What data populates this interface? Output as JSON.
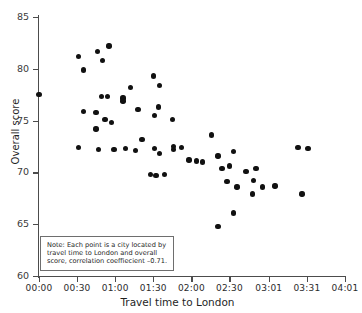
{
  "chart_data": {
    "type": "scatter",
    "title": "",
    "xlabel": "Travel time to London",
    "ylabel": "Overall score",
    "xlim": [
      0,
      241
    ],
    "ylim": [
      60,
      85
    ],
    "grid": false,
    "legend": null,
    "x_tick_labels": [
      "00:00",
      "00:30",
      "01:00",
      "01:30",
      "02:00",
      "02:30",
      "03:01",
      "03:31",
      "04:01"
    ],
    "x_tick_values": [
      0,
      30,
      60,
      90,
      120,
      150,
      181,
      211,
      241
    ],
    "y_tick_labels": [
      "60",
      "65",
      "70",
      "75",
      "80",
      "85"
    ],
    "y_tick_values": [
      60,
      65,
      70,
      75,
      80,
      85
    ],
    "annotation": "Note: Each point is a city located by travel time  to London and overall score, correlation coeffiecient –0.71.",
    "correlation_coefficient": -0.71,
    "point_color": "#111111",
    "axis_color": "#4c4c4c",
    "points": [
      {
        "x": 0,
        "y": 77.5
      },
      {
        "x": 31,
        "y": 81.2
      },
      {
        "x": 35,
        "y": 79.9
      },
      {
        "x": 35,
        "y": 75.9
      },
      {
        "x": 31,
        "y": 72.4
      },
      {
        "x": 46,
        "y": 81.7
      },
      {
        "x": 50,
        "y": 80.8
      },
      {
        "x": 55,
        "y": 82.2
      },
      {
        "x": 49,
        "y": 77.3
      },
      {
        "x": 54,
        "y": 77.3
      },
      {
        "x": 45,
        "y": 75.8
      },
      {
        "x": 45,
        "y": 74.2
      },
      {
        "x": 52,
        "y": 75.1
      },
      {
        "x": 57,
        "y": 74.8
      },
      {
        "x": 47,
        "y": 72.2
      },
      {
        "x": 59,
        "y": 72.2
      },
      {
        "x": 66,
        "y": 76.9
      },
      {
        "x": 66,
        "y": 77.2
      },
      {
        "x": 72,
        "y": 78.2
      },
      {
        "x": 78,
        "y": 76.1
      },
      {
        "x": 68,
        "y": 72.3
      },
      {
        "x": 76,
        "y": 72.1
      },
      {
        "x": 81,
        "y": 73.2
      },
      {
        "x": 88,
        "y": 69.8
      },
      {
        "x": 92,
        "y": 69.7
      },
      {
        "x": 99,
        "y": 69.8
      },
      {
        "x": 90,
        "y": 79.3
      },
      {
        "x": 95,
        "y": 78.4
      },
      {
        "x": 91,
        "y": 75.5
      },
      {
        "x": 94,
        "y": 76.3
      },
      {
        "x": 91,
        "y": 72.3
      },
      {
        "x": 95,
        "y": 71.8
      },
      {
        "x": 105,
        "y": 75.1
      },
      {
        "x": 106,
        "y": 72.5
      },
      {
        "x": 106,
        "y": 72.2
      },
      {
        "x": 112,
        "y": 72.4
      },
      {
        "x": 118,
        "y": 71.2
      },
      {
        "x": 124,
        "y": 71.1
      },
      {
        "x": 129,
        "y": 71.0
      },
      {
        "x": 136,
        "y": 73.6
      },
      {
        "x": 141,
        "y": 71.6
      },
      {
        "x": 144,
        "y": 70.4
      },
      {
        "x": 153,
        "y": 72.0
      },
      {
        "x": 150,
        "y": 70.6
      },
      {
        "x": 148,
        "y": 69.1
      },
      {
        "x": 156,
        "y": 68.6
      },
      {
        "x": 163,
        "y": 70.1
      },
      {
        "x": 171,
        "y": 70.4
      },
      {
        "x": 169,
        "y": 69.2
      },
      {
        "x": 168,
        "y": 67.9
      },
      {
        "x": 176,
        "y": 68.6
      },
      {
        "x": 186,
        "y": 68.7
      },
      {
        "x": 153,
        "y": 66.1
      },
      {
        "x": 141,
        "y": 64.8
      },
      {
        "x": 204,
        "y": 72.4
      },
      {
        "x": 212,
        "y": 72.3
      },
      {
        "x": 207,
        "y": 67.9
      }
    ]
  }
}
